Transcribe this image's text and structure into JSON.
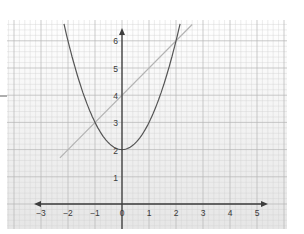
{
  "chart_data": {
    "type": "line",
    "title": "",
    "xlabel": "",
    "ylabel": "",
    "xlim": [
      -3,
      5
    ],
    "ylim": [
      0,
      6
    ],
    "grid": true,
    "legend": null,
    "x_ticks": [
      "-3",
      "-2",
      "-1",
      "0",
      "1",
      "2",
      "3",
      "4",
      "5"
    ],
    "y_ticks": [
      "1",
      "2",
      "3",
      "4",
      "5",
      "6"
    ],
    "series": [
      {
        "name": "parabola y = x^2 + 2",
        "color": "#555555",
        "x": [
          -2.1,
          -2,
          -1.5,
          -1,
          -0.5,
          0,
          0.5,
          1,
          1.5,
          2,
          2.1
        ],
        "y": [
          6.41,
          6,
          4.25,
          3,
          2.25,
          2,
          2.25,
          3,
          4.25,
          6,
          6.41
        ]
      },
      {
        "name": "line y = x + 4",
        "color": "#b0b0b0",
        "x": [
          -2.3,
          2.6
        ],
        "y": [
          1.7,
          6.6
        ]
      }
    ],
    "annotations": [
      {
        "label": "intersection",
        "x": -1,
        "y": 3
      },
      {
        "label": "intersection",
        "x": 2,
        "y": 6
      }
    ]
  },
  "axis": {
    "x_labels": [
      "−3",
      "−2",
      "−1",
      "0",
      "1",
      "2",
      "3",
      "4",
      "5"
    ],
    "y_labels": [
      "1",
      "2",
      "3",
      "4",
      "5",
      "6"
    ]
  },
  "colors": {
    "paper_top": "#ffffff",
    "paper_bottom": "#e6e6e6",
    "grid_minor": "#d2d2d2",
    "grid_major": "#b4b4b4",
    "axis": "#3c3c3c",
    "parabola": "#555555",
    "line": "#b3b3b3"
  }
}
